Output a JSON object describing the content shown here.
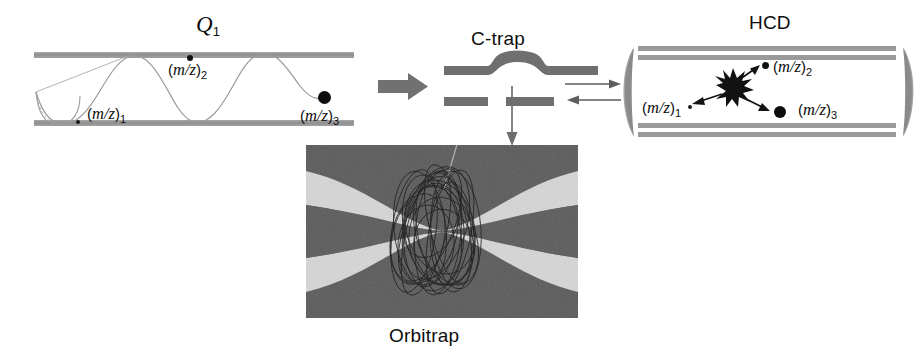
{
  "figure": {
    "caption_none": "",
    "sections": {
      "q1": {
        "title_main": "Q",
        "title_sub": "1",
        "labels": [
          {
            "name": "mz1",
            "pre": "(",
            "italic": "m/z",
            "post": ")",
            "sub": "1"
          },
          {
            "name": "mz2",
            "pre": "(",
            "italic": "m/z",
            "post": ")",
            "sub": "2"
          },
          {
            "name": "mz3",
            "pre": "(",
            "italic": "m/z",
            "post": ")",
            "sub": "3"
          }
        ]
      },
      "ctrap": {
        "title": "C-trap"
      },
      "hcd": {
        "title": "HCD",
        "labels": [
          {
            "name": "mz1",
            "pre": "(",
            "italic": "m/z",
            "post": ")",
            "sub": "1"
          },
          {
            "name": "mz2",
            "pre": "(",
            "italic": "m/z",
            "post": ")",
            "sub": "2"
          },
          {
            "name": "mz3",
            "pre": "(",
            "italic": "m/z",
            "post": ")",
            "sub": "3"
          }
        ]
      },
      "orbitrap": {
        "title": "Orbitrap"
      }
    },
    "arrows": {
      "q1_to_ctrap": "thick-right-arrow",
      "ctrap_to_hcd": "thin-right-arrow",
      "hcd_to_ctrap": "thin-left-arrow",
      "ctrap_to_orbitrap": "thin-down-arrow"
    },
    "colors": {
      "electrode_gray": "#9a9a9a",
      "electrode_dark": "#6f6f6f",
      "orbitrap_dark": "#585858",
      "orbitrap_light": "#d8d8d8",
      "ion_black": "#111111",
      "trajectory_gray": "#8a8a8a",
      "background": "#ffffff"
    }
  }
}
